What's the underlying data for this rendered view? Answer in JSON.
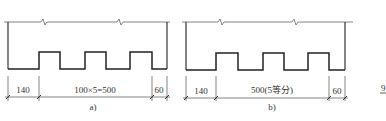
{
  "panels": [
    {
      "id": "a",
      "caption": "a)",
      "dimensions": {
        "left": "140",
        "middle": "100×5=500",
        "right": "60"
      }
    },
    {
      "id": "b",
      "caption": "b)",
      "dimensions": {
        "left": "140",
        "middle": "500(5等分)",
        "right": "60"
      }
    }
  ],
  "edge_fragment": "9",
  "colors": {
    "line": "#222222",
    "thin_line": "#666666",
    "text": "#333333",
    "background": "#ffffff"
  }
}
